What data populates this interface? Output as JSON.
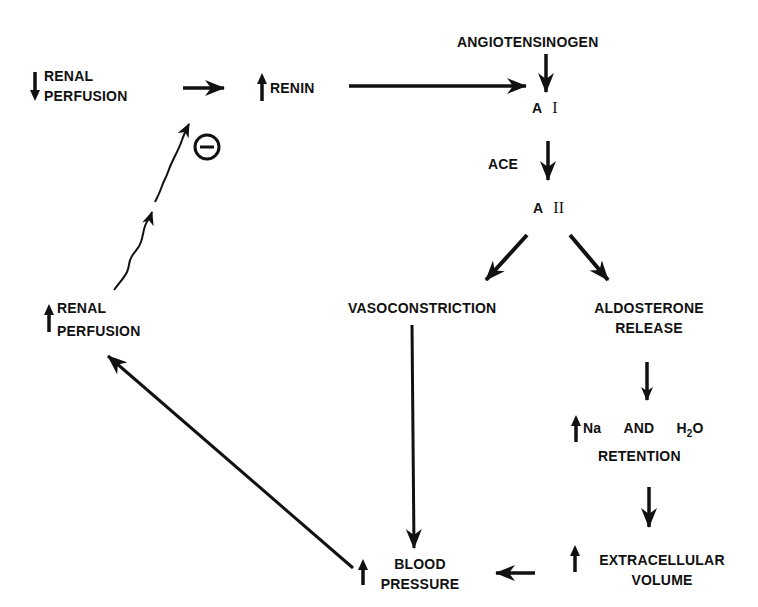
{
  "diagram": {
    "colors": {
      "ink": "#111111",
      "background": "#ffffff"
    },
    "nodes": {
      "renal_perfusion_down": {
        "line1": "RENAL",
        "line2": "PERFUSION",
        "direction": "down"
      },
      "renin_up": {
        "text": "RENIN",
        "direction": "up"
      },
      "angiotensinogen": {
        "text": "ANGIOTENSINOGEN"
      },
      "angiotensin_1": {
        "prefix": "A",
        "numeral": "I"
      },
      "ace": {
        "text": "ACE"
      },
      "angiotensin_2": {
        "prefix": "A",
        "numeral": "II"
      },
      "vasoconstriction": {
        "text": "VASOCONSTRICTION"
      },
      "aldosterone_release": {
        "line1": "ALDOSTERONE",
        "line2": "RELEASE"
      },
      "na_h2o_retention": {
        "na": "Na",
        "and": "AND",
        "h": "H",
        "sub": "2",
        "o": "O",
        "line2": "RETENTION",
        "direction": "up"
      },
      "extracellular_volume": {
        "line1": "EXTRACELLULAR",
        "line2": "VOLUME",
        "direction": "up"
      },
      "blood_pressure": {
        "line1": "BLOOD",
        "line2": "PRESSURE",
        "direction": "up"
      },
      "renal_perfusion_up": {
        "line1": "RENAL",
        "line2": "PERFUSION",
        "direction": "up"
      }
    },
    "inhibition_symbol": "minus-circle",
    "edges": [
      {
        "from": "renal_perfusion_down",
        "to": "renin_up"
      },
      {
        "from": "renin_up",
        "to": "angiotensin_1"
      },
      {
        "from": "angiotensinogen",
        "to": "angiotensin_1"
      },
      {
        "from": "angiotensin_1",
        "to": "angiotensin_2",
        "label": "ACE"
      },
      {
        "from": "angiotensin_2",
        "to": "vasoconstriction"
      },
      {
        "from": "angiotensin_2",
        "to": "aldosterone_release"
      },
      {
        "from": "aldosterone_release",
        "to": "na_h2o_retention"
      },
      {
        "from": "na_h2o_retention",
        "to": "extracellular_volume"
      },
      {
        "from": "extracellular_volume",
        "to": "blood_pressure"
      },
      {
        "from": "vasoconstriction",
        "to": "blood_pressure"
      },
      {
        "from": "blood_pressure",
        "to": "renal_perfusion_up"
      },
      {
        "from": "renal_perfusion_up",
        "to": "renin_up",
        "type": "inhibition"
      }
    ]
  }
}
